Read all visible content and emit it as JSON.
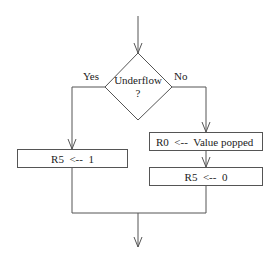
{
  "flowchart": {
    "decision": {
      "line1": "Underflow",
      "line2": "?"
    },
    "branches": {
      "yes_label": "Yes",
      "no_label": "No"
    },
    "boxes": {
      "yes_set_r5": "R5  <--  1",
      "no_pop_value": "R0  <--  Value popped",
      "no_set_r5": "R5  <--  0"
    }
  },
  "colors": {
    "line": "#555555",
    "text": "#222222",
    "background": "#ffffff"
  }
}
